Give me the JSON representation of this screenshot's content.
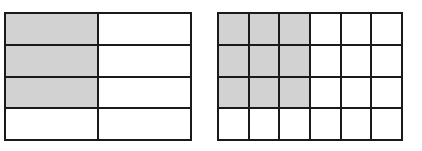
{
  "figures": [
    {
      "id": "left",
      "rows": 4,
      "cols": 2,
      "shaded": [
        [
          1,
          0
        ],
        [
          1,
          0
        ],
        [
          1,
          0
        ],
        [
          0,
          0
        ]
      ],
      "shaded_count": 3,
      "total_cells": 8
    },
    {
      "id": "right",
      "rows": 4,
      "cols": 6,
      "shaded": [
        [
          1,
          1,
          1,
          0,
          0,
          0
        ],
        [
          1,
          1,
          1,
          0,
          0,
          0
        ],
        [
          1,
          1,
          1,
          0,
          0,
          0
        ],
        [
          0,
          0,
          0,
          0,
          0,
          0
        ]
      ],
      "shaded_count": 9,
      "total_cells": 24
    }
  ],
  "colors": {
    "shade": "#d2d2d2",
    "line": "#1a1a1a",
    "background": "#ffffff"
  }
}
